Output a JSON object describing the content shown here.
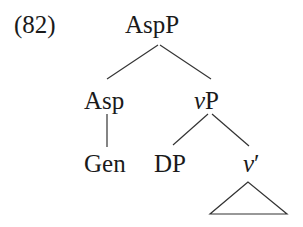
{
  "example_number": "(82)",
  "tree": {
    "root": "AspP",
    "asp": "Asp",
    "gen": "Gen",
    "vp_italic": "v",
    "vp_rest": "P",
    "dp": "DP",
    "vbar_italic": "v",
    "vbar_prime": "′"
  }
}
